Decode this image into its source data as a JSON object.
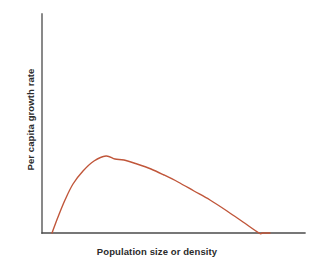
{
  "figure": {
    "background_color": "#ffffff",
    "width": 314,
    "height": 261
  },
  "axes": {
    "color": "#4a4a4a",
    "line_width": 1.3,
    "x_axis": {
      "x_start": 42,
      "x_end": 305,
      "y": 233
    },
    "y_axis": {
      "x": 42,
      "y_top": 14,
      "y_bottom": 233
    }
  },
  "chart_data": {
    "type": "line",
    "title": "",
    "subtitle": "",
    "xlabel": "Population size or density",
    "ylabel": "Per capita growth rate",
    "series": [
      {
        "name": "Per capita growth rate",
        "color": "#c0563a",
        "line_width": 1.4,
        "description": "Hump-shaped curve (Allee effect): growth rate is zero at a low population threshold, rises steeply to a maximum at intermediate density, then declines roughly linearly to zero at carrying capacity.",
        "x": [
          0.038,
          0.06,
          0.085,
          0.115,
          0.15,
          0.19,
          0.235,
          0.266,
          0.3,
          0.35,
          0.4,
          0.45,
          0.5,
          0.56,
          0.62,
          0.68,
          0.74,
          0.8,
          0.86,
          0.91,
          0.95,
          0.985,
          1.0
        ],
        "y": [
          0.0,
          0.11,
          0.23,
          0.35,
          0.45,
          0.53,
          0.57,
          0.58,
          0.578,
          0.565,
          0.545,
          0.52,
          0.49,
          0.45,
          0.408,
          0.362,
          0.314,
          0.262,
          0.206,
          0.15,
          0.098,
          0.03,
          0.0
        ],
        "x_pixels": [
          52,
          58,
          65,
          73,
          83,
          94,
          106,
          115,
          124,
          137,
          151,
          164,
          178,
          194,
          210,
          227,
          243,
          259,
          262,
          266,
          268,
          269,
          270
        ],
        "y_pixels": [
          233,
          217,
          200,
          184,
          171,
          161,
          156,
          159,
          160,
          164,
          169,
          175,
          182,
          191,
          200,
          211,
          222,
          233,
          233,
          233,
          233,
          233,
          233
        ]
      }
    ],
    "xlim": [
      0,
      1
    ],
    "ylim": [
      0,
      1
    ],
    "xticks": [],
    "yticks": [],
    "xticklabels": [],
    "yticklabels": [],
    "grid": false,
    "legend": false,
    "legend_position": "none",
    "annotations": [],
    "curve_features": {
      "zero_growth_lower_x_pixel": 52,
      "peak_x_pixel": 112,
      "peak_y_pixel": 159,
      "zero_growth_upper_x_pixel": 270
    }
  }
}
